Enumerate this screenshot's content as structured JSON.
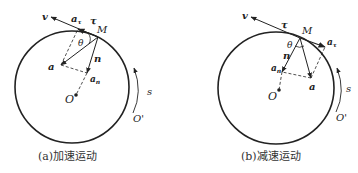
{
  "figure": {
    "panels": [
      {
        "id": "a",
        "caption": "(a)加速运动",
        "labels": {
          "velocity": "v",
          "tangential_accel": "a",
          "tangential_accel_sub": "τ",
          "tangent_unit": "τ",
          "point": "M",
          "angle": "θ",
          "total_accel": "a",
          "normal_unit": "n",
          "normal_accel": "a",
          "normal_accel_sub": "n",
          "center": "O",
          "arc_coord": "s",
          "origin": "O'"
        }
      },
      {
        "id": "b",
        "caption": "(b)减速运动",
        "labels": {
          "velocity": "v",
          "tangent_unit": "τ",
          "point": "M",
          "angle": "θ",
          "tangential_accel": "a",
          "tangential_accel_sub": "τ",
          "normal_unit": "n",
          "normal_accel": "a",
          "normal_accel_sub": "n",
          "total_accel": "a",
          "center": "O",
          "arc_coord": "s",
          "origin": "O'"
        }
      }
    ],
    "colors": {
      "stroke": "#222222",
      "background": "#ffffff"
    }
  }
}
